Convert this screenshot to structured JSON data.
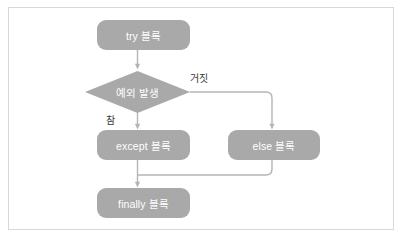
{
  "figure": {
    "background_color": "#ffffff",
    "frame_border_color": "#d8d8d8",
    "node_fill_color": "#a9a9a9",
    "node_text_color": "#ffffff",
    "connector_color": "#b5b5b5",
    "edge_label_color": "#3a3a3a"
  },
  "nodes": [
    {
      "id": "try",
      "label": "try 블록",
      "shape": "rounded-rect",
      "x": 97,
      "y": 20,
      "width": 93,
      "height": 30
    },
    {
      "id": "decision",
      "label": "예외 발생",
      "shape": "diamond",
      "x": 85,
      "y": 71,
      "width": 105,
      "height": 42
    },
    {
      "id": "except",
      "label": "except 블록",
      "shape": "rounded-rect",
      "x": 97,
      "y": 130,
      "width": 93,
      "height": 30
    },
    {
      "id": "else",
      "label": "else 블록",
      "shape": "rounded-rect",
      "x": 228,
      "y": 130,
      "width": 92,
      "height": 30
    },
    {
      "id": "finally",
      "label": "finally 블록",
      "shape": "rounded-rect",
      "x": 97,
      "y": 188,
      "width": 93,
      "height": 30
    }
  ],
  "edges": [
    {
      "id": "try-to-decision",
      "from": "try",
      "to": "decision",
      "label": "",
      "arrow": true
    },
    {
      "id": "decision-true-to-except",
      "from": "decision",
      "to": "except",
      "label": "참",
      "label_x": 106,
      "label_y": 112,
      "arrow": true
    },
    {
      "id": "decision-false-to-else",
      "from": "decision",
      "to": "else",
      "label": "거짓",
      "label_x": 190,
      "label_y": 70,
      "arrow": true
    },
    {
      "id": "except-to-finally",
      "from": "except",
      "to": "finally",
      "label": "",
      "arrow": true
    },
    {
      "id": "else-to-finally",
      "from": "else",
      "to": "finally",
      "label": "",
      "arrow": false
    }
  ]
}
